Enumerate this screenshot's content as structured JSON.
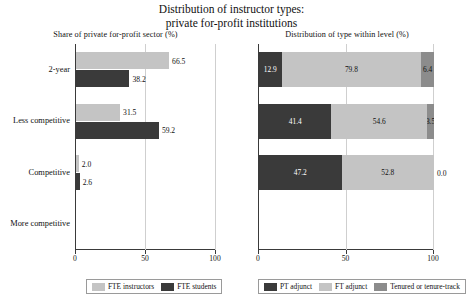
{
  "title_line1": "Distribution of instructor types:",
  "title_line2": "private for-profit institutions",
  "colors": {
    "light": "#c4c4c4",
    "dark": "#3a3a3a",
    "medium": "#8c8c8c",
    "axis": "#3a3a3a",
    "grid": "#cfcfcf",
    "label_on_dark": "#ffffff",
    "label_on_light": "#111111"
  },
  "legend_left": [
    {
      "label": "FTE instructors",
      "color": "#c4c4c4"
    },
    {
      "label": "FTE students",
      "color": "#3a3a3a"
    }
  ],
  "legend_right": [
    {
      "label": "PT adjunct",
      "color": "#3a3a3a"
    },
    {
      "label": "FT adjunct",
      "color": "#c4c4c4"
    },
    {
      "label": "Tenured or tenure-track",
      "color": "#8c8c8c"
    }
  ],
  "chart_data": [
    {
      "type": "bar",
      "orientation": "horizontal",
      "panel": "left",
      "title": "Share of private for-profit sector (%)",
      "xlabel": "",
      "ylabel": "",
      "xlim": [
        0,
        100
      ],
      "xticks": [
        0,
        50,
        100
      ],
      "xticklabels": [
        "0",
        "50",
        "100"
      ],
      "grid": true,
      "legend_position": "bottom",
      "categories": [
        "2-year",
        "Less competitive",
        "Competitive",
        "More competitive"
      ],
      "series": [
        {
          "name": "FTE instructors",
          "color": "#c4c4c4",
          "values": [
            66.5,
            31.5,
            2.0,
            0.0
          ],
          "labels": [
            "66.5",
            "31.5",
            "2.0",
            ""
          ]
        },
        {
          "name": "FTE students",
          "color": "#3a3a3a",
          "values": [
            38.2,
            59.2,
            2.6,
            0.0
          ],
          "labels": [
            "38.2",
            "59.2",
            "2.6",
            ""
          ]
        }
      ]
    },
    {
      "type": "bar",
      "orientation": "horizontal",
      "stacked": true,
      "panel": "right",
      "title": "Distribution of type within level (%)",
      "xlabel": "",
      "ylabel": "",
      "xlim": [
        0,
        100
      ],
      "xticks": [
        0,
        50,
        100
      ],
      "xticklabels": [
        "0",
        "50",
        "100"
      ],
      "grid": true,
      "legend_position": "bottom",
      "categories": [
        "2-year",
        "Less competitive",
        "Competitive",
        "More competitive"
      ],
      "series": [
        {
          "name": "PT adjunct",
          "color": "#3a3a3a",
          "values": [
            12.9,
            41.4,
            47.2,
            0.0
          ],
          "labels": [
            "12.9",
            "41.4",
            "47.2",
            ""
          ]
        },
        {
          "name": "FT adjunct",
          "color": "#c4c4c4",
          "values": [
            79.8,
            54.6,
            52.8,
            0.0
          ],
          "labels": [
            "79.8",
            "54.6",
            "52.8",
            ""
          ]
        },
        {
          "name": "Tenured or tenure-track",
          "color": "#8c8c8c",
          "values": [
            7.3,
            4.0,
            0.0,
            0.0
          ],
          "labels": [
            "6.4",
            "3.5",
            "0.0",
            ""
          ]
        }
      ]
    }
  ]
}
